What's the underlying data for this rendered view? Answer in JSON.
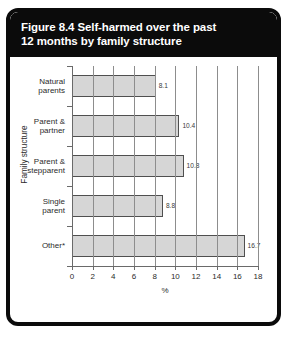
{
  "figure": {
    "title_line1": "Figure 8.4 Self-harmed over the past",
    "title_line2": "12 months by family structure"
  },
  "chart_data": {
    "type": "bar",
    "orientation": "horizontal",
    "title": "Figure 8.4 Self-harmed over the past 12 months by family structure",
    "categories": [
      "Natural parents",
      "Parent & partner",
      "Parent & stepparent",
      "Single parent",
      "Other*"
    ],
    "category_lines": [
      [
        "Natural",
        "parents"
      ],
      [
        "Parent &",
        "partner"
      ],
      [
        "Parent &",
        "stepparent"
      ],
      [
        "Single",
        "parent"
      ],
      [
        "Other*"
      ]
    ],
    "values": [
      8.1,
      10.4,
      10.8,
      8.8,
      16.7
    ],
    "value_labels": [
      "8.1",
      "10.4",
      "10.8",
      "8.8",
      "16.7"
    ],
    "xlabel": "%",
    "ylabel": "Family structure",
    "xlim": [
      0,
      18
    ],
    "xticks": [
      0,
      2,
      4,
      6,
      8,
      10,
      12,
      14,
      16,
      18
    ],
    "xtick_labels": [
      "0",
      "2",
      "4",
      "6",
      "8",
      "10",
      "12",
      "14",
      "16",
      "18"
    ],
    "grid": "vertical",
    "legend": "none",
    "colors": {
      "bar_fill": "#d6d6d6",
      "bar_edge": "#4f4f4f",
      "gridline": "#8d8d8d",
      "frame": "#0b0b0b",
      "banner_bg": "#0b0b0b",
      "banner_text": "#ffffff",
      "text": "#2b2b2b"
    }
  }
}
